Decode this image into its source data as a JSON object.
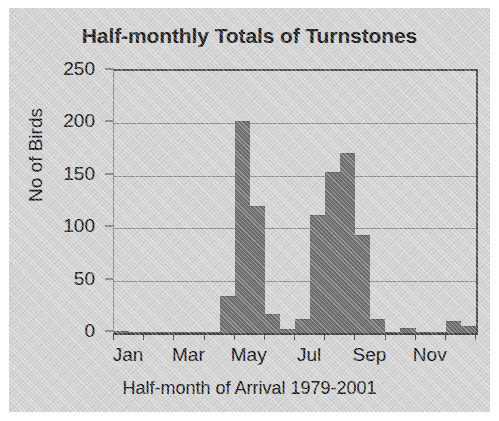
{
  "chart_data": {
    "type": "bar",
    "title": "Half-monthly Totals of Turnstones",
    "xlabel": "Half-month of Arrival 1979-2001",
    "ylabel": "No of Birds",
    "ylim": [
      0,
      250
    ],
    "ytick_values": [
      0,
      50,
      100,
      150,
      200,
      250
    ],
    "ytick_labels": [
      "0",
      "50",
      "100",
      "150",
      "200",
      "250"
    ],
    "grid": true,
    "legend": false,
    "bar_color": "#6e6e6e",
    "categories": [
      "Jan-1",
      "Jan-2",
      "Feb-1",
      "Feb-2",
      "Mar-1",
      "Mar-2",
      "Apr-1",
      "Apr-2",
      "May-1",
      "May-2",
      "Jun-1",
      "Jun-2",
      "Jul-1",
      "Jul-2",
      "Aug-1",
      "Aug-2",
      "Sep-1",
      "Sep-2",
      "Oct-1",
      "Oct-2",
      "Nov-1",
      "Nov-2",
      "Dec-1",
      "Dec-2"
    ],
    "values": [
      2,
      1,
      0,
      0,
      1,
      1,
      0,
      35,
      202,
      121,
      18,
      4,
      13,
      113,
      154,
      172,
      94,
      13,
      1,
      5,
      1,
      1,
      11,
      7
    ],
    "xtick_labels": [
      "Jan",
      "Mar",
      "May",
      "Jul",
      "Sep",
      "Nov"
    ],
    "xtick_categories": [
      "Jan",
      "Mar",
      "May",
      "Jul",
      "Sep",
      "Nov"
    ]
  }
}
